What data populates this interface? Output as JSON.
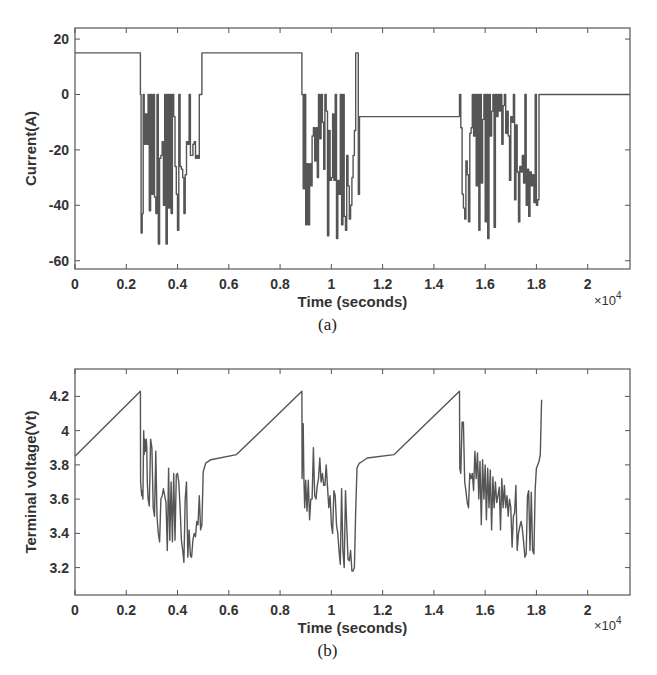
{
  "chart_data": [
    {
      "id": "a",
      "type": "line",
      "caption": "(a)",
      "title": "",
      "xlabel": "Time (seconds)",
      "ylabel": "Current(A)",
      "x_multiplier_label": "×10",
      "x_multiplier_exp": "4",
      "xlim": [
        0,
        2.165
      ],
      "ylim": [
        -63,
        24
      ],
      "xticks": [
        0,
        0.2,
        0.4,
        0.6,
        0.8,
        1,
        1.2,
        1.4,
        1.6,
        1.8,
        2
      ],
      "xtick_labels": [
        "0",
        "0.2",
        "0.4",
        "0.6",
        "0.8",
        "1",
        "1.2",
        "1.4",
        "1.6",
        "1.8",
        "2"
      ],
      "yticks": [
        -60,
        -40,
        -20,
        0,
        20
      ],
      "ytick_labels": [
        "-60",
        "-40",
        "-20",
        "0",
        "20"
      ],
      "grid": false,
      "series": [
        {
          "name": "Current",
          "x": [
            0,
            0.255,
            0.255,
            0.258,
            0.258,
            0.262,
            0.262,
            0.266,
            0.266,
            0.27,
            0.27,
            0.275,
            0.275,
            0.28,
            0.28,
            0.285,
            0.285,
            0.29,
            0.29,
            0.295,
            0.295,
            0.3,
            0.3,
            0.305,
            0.305,
            0.31,
            0.31,
            0.315,
            0.315,
            0.32,
            0.32,
            0.325,
            0.325,
            0.33,
            0.33,
            0.335,
            0.335,
            0.34,
            0.34,
            0.345,
            0.345,
            0.35,
            0.35,
            0.355,
            0.355,
            0.36,
            0.36,
            0.365,
            0.365,
            0.37,
            0.37,
            0.375,
            0.375,
            0.38,
            0.38,
            0.385,
            0.385,
            0.39,
            0.39,
            0.395,
            0.395,
            0.4,
            0.4,
            0.405,
            0.405,
            0.41,
            0.41,
            0.415,
            0.415,
            0.42,
            0.42,
            0.425,
            0.425,
            0.43,
            0.43,
            0.435,
            0.435,
            0.44,
            0.44,
            0.445,
            0.445,
            0.45,
            0.45,
            0.455,
            0.455,
            0.46,
            0.46,
            0.465,
            0.465,
            0.47,
            0.47,
            0.475,
            0.475,
            0.48,
            0.48,
            0.485,
            0.485,
            0.49,
            0.49,
            0.495,
            0.495,
            0.885,
            0.885,
            0.89,
            0.89,
            0.895,
            0.895,
            0.9,
            0.9,
            0.905,
            0.905,
            0.91,
            0.91,
            0.915,
            0.915,
            0.92,
            0.92,
            0.925,
            0.925,
            0.93,
            0.93,
            0.935,
            0.935,
            0.94,
            0.94,
            0.945,
            0.945,
            0.95,
            0.95,
            0.955,
            0.955,
            0.96,
            0.96,
            0.965,
            0.965,
            0.97,
            0.97,
            0.975,
            0.975,
            0.98,
            0.98,
            0.985,
            0.985,
            0.99,
            0.99,
            0.995,
            0.995,
            1.0,
            1.0,
            1.005,
            1.005,
            1.01,
            1.01,
            1.015,
            1.015,
            1.02,
            1.02,
            1.025,
            1.025,
            1.03,
            1.03,
            1.035,
            1.035,
            1.04,
            1.04,
            1.045,
            1.045,
            1.05,
            1.05,
            1.055,
            1.055,
            1.06,
            1.06,
            1.065,
            1.065,
            1.07,
            1.07,
            1.075,
            1.075,
            1.08,
            1.08,
            1.085,
            1.085,
            1.09,
            1.09,
            1.095,
            1.095,
            1.1,
            1.1,
            1.105,
            1.105,
            1.11,
            1.11,
            1.5,
            1.5,
            1.505,
            1.505,
            1.51,
            1.51,
            1.515,
            1.515,
            1.52,
            1.52,
            1.525,
            1.525,
            1.53,
            1.53,
            1.535,
            1.535,
            1.54,
            1.54,
            1.545,
            1.545,
            1.55,
            1.55,
            1.555,
            1.555,
            1.56,
            1.56,
            1.565,
            1.565,
            1.57,
            1.57,
            1.575,
            1.575,
            1.58,
            1.58,
            1.585,
            1.585,
            1.59,
            1.59,
            1.595,
            1.595,
            1.6,
            1.6,
            1.605,
            1.605,
            1.61,
            1.61,
            1.615,
            1.615,
            1.62,
            1.62,
            1.625,
            1.625,
            1.63,
            1.63,
            1.635,
            1.635,
            1.64,
            1.64,
            1.645,
            1.645,
            1.65,
            1.65,
            1.655,
            1.655,
            1.66,
            1.66,
            1.665,
            1.665,
            1.67,
            1.67,
            1.675,
            1.675,
            1.68,
            1.68,
            1.685,
            1.685,
            1.69,
            1.69,
            1.695,
            1.695,
            1.7,
            1.7,
            1.705,
            1.705,
            1.71,
            1.71,
            1.715,
            1.715,
            1.72,
            1.72,
            1.725,
            1.725,
            1.73,
            1.73,
            1.735,
            1.735,
            1.74,
            1.74,
            1.745,
            1.745,
            1.75,
            1.75,
            1.755,
            1.755,
            1.76,
            1.76,
            1.765,
            1.765,
            1.77,
            1.77,
            1.775,
            1.775,
            1.78,
            1.78,
            1.785,
            1.785,
            1.79,
            1.79,
            1.795,
            1.795,
            1.8,
            1.8,
            1.805,
            1.805,
            1.81,
            1.81,
            2.165
          ],
          "y": [
            15,
            15,
            0,
            0,
            -50,
            -50,
            -43,
            -43,
            0,
            0,
            -18,
            -18,
            -7,
            -7,
            -18,
            -18,
            0,
            0,
            -42,
            -42,
            0,
            0,
            -36,
            -36,
            0,
            0,
            -37,
            -37,
            -43,
            -43,
            0,
            0,
            -54,
            -54,
            -23,
            -23,
            -22,
            -22,
            -17,
            -17,
            -40,
            -40,
            0,
            0,
            -54,
            -54,
            0,
            0,
            -41,
            -41,
            0,
            0,
            -43,
            -43,
            0,
            0,
            -8,
            -8,
            -26,
            -26,
            -36,
            -36,
            -49,
            -49,
            0,
            0,
            -26,
            -26,
            -27,
            -27,
            -30,
            -30,
            -43,
            -43,
            -29,
            -29,
            -17,
            -17,
            -18,
            -18,
            0,
            0,
            -22,
            -22,
            -22,
            -22,
            -18,
            -18,
            -17,
            -17,
            -23,
            -23,
            -22,
            -22,
            -23,
            -23,
            0,
            0,
            0,
            0,
            15,
            15,
            0,
            0,
            -34,
            -34,
            0,
            0,
            -47,
            -47,
            -25,
            -25,
            -47,
            -47,
            -25,
            -25,
            -33,
            -33,
            -15,
            -15,
            -12,
            -12,
            -24,
            -24,
            -12,
            -12,
            -30,
            -30,
            0,
            0,
            -16,
            -16,
            0,
            0,
            -10,
            -10,
            -27,
            -27,
            0,
            0,
            -6,
            -6,
            -51,
            -51,
            -13,
            -13,
            -31,
            -31,
            -30,
            -30,
            -7,
            -7,
            -31,
            -31,
            0,
            0,
            -52,
            -52,
            -31,
            -31,
            -36,
            -36,
            0,
            0,
            -47,
            -47,
            0,
            0,
            -44,
            -44,
            -49,
            -49,
            -22,
            -22,
            -33,
            -33,
            -45,
            -45,
            -40,
            -40,
            -30,
            -30,
            -22,
            -22,
            -13,
            -13,
            15,
            15,
            15,
            15,
            -36,
            -36,
            -8,
            -8,
            0,
            0,
            -12,
            -12,
            -36,
            -36,
            -41,
            -41,
            -45,
            -45,
            -24,
            -24,
            -29,
            -29,
            -46,
            -46,
            -14,
            -14,
            -12,
            -12,
            0,
            0,
            -15,
            -15,
            0,
            0,
            -33,
            -33,
            0,
            0,
            -49,
            -49,
            0,
            0,
            -32,
            -32,
            -9,
            -9,
            0,
            0,
            -46,
            -46,
            0,
            0,
            -52,
            -52,
            0,
            0,
            -15,
            -15,
            -6,
            -6,
            0,
            0,
            -48,
            -48,
            0,
            0,
            -8,
            -8,
            0,
            0,
            -6,
            -6,
            0,
            0,
            -18,
            -18,
            -4,
            -4,
            0,
            0,
            -14,
            -14,
            -6,
            -6,
            -15,
            -15,
            -31,
            -31,
            -8,
            -8,
            -10,
            -10,
            0,
            0,
            -38,
            -38,
            -11,
            -11,
            -28,
            -28,
            -46,
            -46,
            -26,
            -26,
            -28,
            -28,
            -22,
            -22,
            -32,
            -32,
            0,
            0,
            -40,
            -40,
            -27,
            -27,
            -44,
            -44,
            -28,
            -28,
            -33,
            -33,
            -29,
            -29,
            -39,
            -39,
            0,
            0,
            -40,
            -40,
            -38,
            -38,
            0,
            0,
            -37,
            -37,
            15,
            15
          ]
        }
      ]
    },
    {
      "id": "b",
      "type": "line",
      "caption": "(b)",
      "title": "",
      "xlabel": "Time (seconds)",
      "ylabel": "Terminal voltage(Vt)",
      "x_multiplier_label": "×10",
      "x_multiplier_exp": "4",
      "xlim": [
        0,
        2.165
      ],
      "ylim": [
        3.04,
        4.36
      ],
      "xticks": [
        0,
        0.2,
        0.4,
        0.6,
        0.8,
        1,
        1.2,
        1.4,
        1.6,
        1.8,
        2
      ],
      "xtick_labels": [
        "0",
        "0.2",
        "0.4",
        "0.6",
        "0.8",
        "1",
        "1.2",
        "1.4",
        "1.6",
        "1.8",
        "2"
      ],
      "yticks": [
        3.2,
        3.4,
        3.6,
        3.8,
        4.0,
        4.2
      ],
      "ytick_labels": [
        "3.2",
        "3.4",
        "3.6",
        "3.8",
        "4",
        "4.2"
      ],
      "grid": false,
      "series": [
        {
          "name": "Terminal voltage",
          "x": [
            0,
            0.255,
            0.256,
            0.26,
            0.262,
            0.265,
            0.268,
            0.27,
            0.272,
            0.275,
            0.278,
            0.28,
            0.282,
            0.285,
            0.29,
            0.295,
            0.3,
            0.305,
            0.31,
            0.315,
            0.32,
            0.325,
            0.33,
            0.335,
            0.34,
            0.345,
            0.35,
            0.355,
            0.36,
            0.365,
            0.37,
            0.375,
            0.38,
            0.385,
            0.39,
            0.395,
            0.4,
            0.405,
            0.41,
            0.415,
            0.42,
            0.425,
            0.43,
            0.435,
            0.44,
            0.445,
            0.45,
            0.455,
            0.46,
            0.465,
            0.47,
            0.475,
            0.48,
            0.485,
            0.49,
            0.495,
            0.5,
            0.51,
            0.53,
            0.63,
            0.885,
            0.886,
            0.89,
            0.893,
            0.896,
            0.9,
            0.905,
            0.91,
            0.915,
            0.92,
            0.925,
            0.93,
            0.935,
            0.94,
            0.945,
            0.95,
            0.955,
            0.96,
            0.965,
            0.97,
            0.975,
            0.98,
            0.985,
            0.99,
            0.995,
            1.0,
            1.005,
            1.01,
            1.015,
            1.02,
            1.025,
            1.03,
            1.035,
            1.04,
            1.045,
            1.05,
            1.055,
            1.06,
            1.065,
            1.07,
            1.075,
            1.08,
            1.085,
            1.09,
            1.095,
            1.1,
            1.105,
            1.11,
            1.12,
            1.14,
            1.245,
            1.5,
            1.501,
            1.505,
            1.51,
            1.515,
            1.52,
            1.525,
            1.53,
            1.535,
            1.54,
            1.545,
            1.55,
            1.555,
            1.56,
            1.565,
            1.57,
            1.575,
            1.58,
            1.585,
            1.59,
            1.595,
            1.6,
            1.605,
            1.61,
            1.615,
            1.62,
            1.625,
            1.63,
            1.635,
            1.64,
            1.645,
            1.65,
            1.655,
            1.66,
            1.665,
            1.67,
            1.675,
            1.68,
            1.685,
            1.69,
            1.695,
            1.7,
            1.705,
            1.71,
            1.715,
            1.72,
            1.725,
            1.73,
            1.735,
            1.74,
            1.745,
            1.75,
            1.755,
            1.76,
            1.765,
            1.77,
            1.775,
            1.78,
            1.785,
            1.79,
            1.795,
            1.8,
            1.805,
            1.81,
            1.815,
            1.82,
            1.83,
            1.85,
            1.945,
            2.165
          ],
          "y": [
            3.85,
            4.23,
            3.7,
            3.62,
            3.65,
            3.6,
            4.0,
            3.86,
            3.95,
            3.88,
            3.95,
            3.9,
            3.7,
            3.6,
            3.56,
            3.95,
            3.9,
            3.55,
            3.5,
            3.88,
            3.5,
            3.4,
            3.35,
            3.6,
            3.62,
            3.66,
            3.62,
            3.58,
            3.3,
            3.78,
            3.36,
            3.7,
            3.35,
            3.75,
            3.36,
            3.74,
            3.75,
            3.7,
            3.55,
            3.36,
            3.3,
            3.23,
            3.6,
            3.7,
            3.26,
            3.42,
            3.27,
            3.26,
            3.36,
            3.4,
            3.38,
            3.47,
            3.45,
            3.62,
            3.42,
            3.45,
            3.76,
            3.81,
            3.83,
            3.86,
            4.23,
            3.72,
            4.04,
            3.72,
            3.55,
            3.71,
            3.53,
            3.71,
            3.48,
            3.6,
            3.6,
            3.9,
            3.62,
            3.6,
            3.68,
            3.72,
            3.84,
            3.7,
            3.75,
            3.68,
            3.68,
            3.8,
            3.67,
            3.55,
            3.62,
            3.45,
            3.4,
            3.65,
            3.62,
            3.45,
            3.4,
            3.3,
            3.22,
            3.66,
            3.3,
            3.2,
            3.65,
            3.45,
            3.25,
            3.24,
            3.3,
            3.18,
            3.18,
            3.2,
            3.53,
            3.78,
            3.8,
            3.81,
            3.82,
            3.84,
            3.86,
            4.23,
            3.78,
            3.75,
            4.05,
            4.05,
            3.7,
            3.65,
            3.58,
            3.55,
            3.75,
            3.72,
            3.75,
            3.65,
            3.88,
            3.72,
            3.87,
            3.6,
            3.82,
            3.45,
            3.83,
            3.6,
            3.8,
            3.48,
            3.78,
            3.55,
            3.77,
            3.42,
            3.73,
            3.55,
            3.7,
            3.58,
            3.62,
            3.67,
            3.42,
            3.72,
            3.55,
            3.68,
            3.55,
            3.62,
            3.5,
            3.6,
            3.55,
            3.32,
            3.5,
            3.52,
            3.68,
            3.3,
            3.4,
            3.44,
            3.47,
            3.43,
            3.35,
            3.26,
            3.28,
            3.62,
            3.65,
            3.3,
            3.64,
            3.3,
            3.28,
            3.66,
            3.78,
            3.8,
            3.82,
            3.86,
            4.18
          ]
        }
      ]
    }
  ]
}
